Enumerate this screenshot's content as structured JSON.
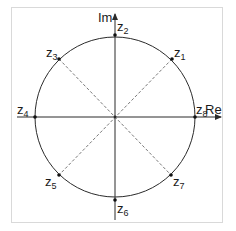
{
  "diagram": {
    "colors": {
      "frame": "#d9d9d9",
      "stroke": "#2b2b2b",
      "dashed": "#555555",
      "text": "#1a1a1a",
      "background": "#ffffff"
    },
    "axes": {
      "real_label": "Re",
      "imag_label": "Im"
    },
    "points": [
      {
        "id": "z1",
        "base": "z",
        "sub": "1",
        "angle_deg": 45
      },
      {
        "id": "z2",
        "base": "z",
        "sub": "2",
        "angle_deg": 90
      },
      {
        "id": "z3",
        "base": "z",
        "sub": "3",
        "angle_deg": 135
      },
      {
        "id": "z4",
        "base": "z",
        "sub": "4",
        "angle_deg": 180
      },
      {
        "id": "z5",
        "base": "z",
        "sub": "5",
        "angle_deg": 225
      },
      {
        "id": "z6",
        "base": "z",
        "sub": "6",
        "angle_deg": 270
      },
      {
        "id": "z7",
        "base": "z",
        "sub": "7",
        "angle_deg": 315
      },
      {
        "id": "z8",
        "base": "z",
        "sub": "8",
        "angle_deg": 0
      }
    ]
  }
}
